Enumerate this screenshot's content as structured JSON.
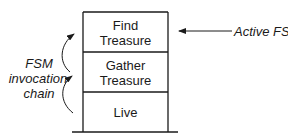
{
  "diagram": {
    "stack": [
      {
        "lines": [
          "Find",
          "Treasure"
        ]
      },
      {
        "lines": [
          "Gather",
          "Treasure"
        ]
      },
      {
        "lines": [
          "Live"
        ]
      }
    ],
    "active_label": "Active FSM",
    "chain_label": [
      "FSM",
      "invocation",
      "chain"
    ]
  }
}
